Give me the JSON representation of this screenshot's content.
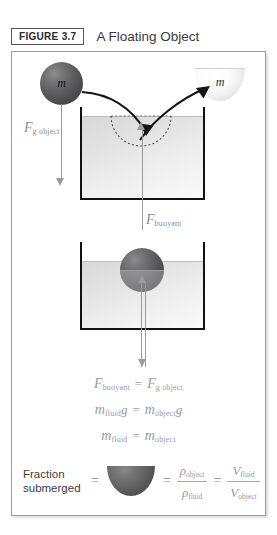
{
  "header": {
    "badge_label": "FIGURE 3.7",
    "title": "A Floating Object"
  },
  "diagram_top": {
    "falling_ball_label": "m",
    "bowl_label": "m",
    "gravity_force": {
      "symbol": "F",
      "subscript": "g object"
    },
    "buoyant_force": {
      "symbol": "F",
      "subscript": "buoyant"
    }
  },
  "diagram_bottom": {
    "floating_ball_label": ""
  },
  "equations": [
    {
      "left": {
        "symbol": "F",
        "subscript": "buoyant"
      },
      "operator": "=",
      "right": {
        "symbol": "F",
        "subscript": "g object"
      }
    },
    {
      "left": {
        "symbol": "m",
        "subscript": "fluid",
        "trailing": "g"
      },
      "operator": "=",
      "right": {
        "symbol": "m",
        "subscript": "object",
        "trailing": "g"
      }
    },
    {
      "left": {
        "symbol": "m",
        "subscript": "fluid"
      },
      "operator": "=",
      "right": {
        "symbol": "m",
        "subscript": "object"
      }
    }
  ],
  "fraction_row": {
    "caption_line1": "Fraction",
    "caption_line2": "submerged",
    "equals_1": "=",
    "equals_2": "=",
    "equals_3": "=",
    "density_fraction": {
      "numerator": {
        "symbol": "ρ",
        "subscript": "object"
      },
      "denominator": {
        "symbol": "ρ",
        "subscript": "fluid"
      }
    },
    "volume_fraction": {
      "numerator": {
        "symbol": "V",
        "subscript": "fluid"
      },
      "denominator": {
        "symbol": "V",
        "subscript": "object"
      }
    }
  },
  "bottom_caption": "",
  "colors": {
    "ball_dark": "#5e5e61",
    "fluid_light": "#e6e6e6",
    "container_stroke": "#111113",
    "force_gray": "#9b9b9d",
    "equation_gray": "#9a9a9c",
    "title_text": "#3a3a3c"
  }
}
